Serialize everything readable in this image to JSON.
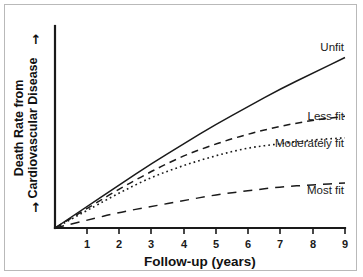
{
  "chart_data": {
    "type": "line",
    "title": "",
    "xlabel": "Follow-up (years)",
    "ylabel": "Death Rate from Cardiovascular Disease",
    "ylabel_line1": "Death Rate from",
    "ylabel_line2": "Cardiovascular Disease",
    "y_arrow_glyph": "↑",
    "grid": false,
    "legend_position": "inline-right",
    "xlim": [
      0,
      9
    ],
    "ylim": [
      0,
      100
    ],
    "x_tick_labels": [
      "1",
      "2",
      "3",
      "4",
      "5",
      "6",
      "7",
      "8",
      "9"
    ],
    "x_ticks": [
      1,
      2,
      3,
      4,
      5,
      6,
      7,
      8,
      9
    ],
    "y_tick_labels": [],
    "x": [
      0,
      1,
      2,
      3,
      4,
      5,
      6,
      7,
      8,
      9
    ],
    "series": [
      {
        "name": "Unfit",
        "label": "Unfit",
        "line_style": "solid",
        "color": "#1a1a1a",
        "values": [
          0,
          11,
          22,
          33,
          43,
          53,
          62,
          71,
          79,
          87
        ]
      },
      {
        "name": "Less fit",
        "label": "Less fit",
        "line_style": "dashed",
        "color": "#1a1a1a",
        "values": [
          0,
          10,
          20,
          29,
          37,
          43,
          48,
          52,
          55,
          57
        ]
      },
      {
        "name": "Moderately fit",
        "label": "Moderately fit",
        "line_style": "dotted",
        "color": "#1a1a1a",
        "values": [
          0,
          9,
          18,
          26,
          32,
          37,
          41,
          43,
          45,
          46
        ]
      },
      {
        "name": "Most fit",
        "label": "Most fit",
        "line_style": "long-dashed",
        "color": "#1a1a1a",
        "values": [
          0,
          4,
          8,
          11,
          14,
          17,
          19,
          21,
          22,
          23
        ]
      }
    ]
  },
  "frame": {
    "border_color": "#b9b9b9",
    "background": "#ffffff",
    "axis_color": "#1a1a1a"
  }
}
